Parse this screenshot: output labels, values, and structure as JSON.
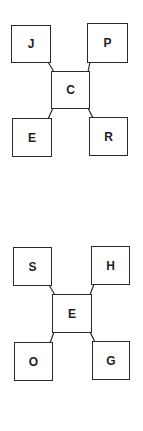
{
  "diagrams": [
    {
      "center": {
        "label": "C",
        "x": 51,
        "y": 71,
        "w": 39,
        "h": 38
      },
      "corners": [
        {
          "pos": "top-left",
          "label": "J",
          "x": 11,
          "y": 25,
          "w": 40,
          "h": 38
        },
        {
          "pos": "top-right",
          "label": "P",
          "x": 87,
          "y": 23,
          "w": 41,
          "h": 40
        },
        {
          "pos": "bottom-left",
          "label": "E",
          "x": 12,
          "y": 118,
          "w": 40,
          "h": 39
        },
        {
          "pos": "bottom-right",
          "label": "R",
          "x": 89,
          "y": 117,
          "w": 39,
          "h": 39
        }
      ]
    },
    {
      "center": {
        "label": "E",
        "x": 52,
        "y": 294,
        "w": 40,
        "h": 39
      },
      "corners": [
        {
          "pos": "top-left",
          "label": "S",
          "x": 13,
          "y": 247,
          "w": 39,
          "h": 39
        },
        {
          "pos": "top-right",
          "label": "H",
          "x": 91,
          "y": 246,
          "w": 39,
          "h": 39
        },
        {
          "pos": "bottom-left",
          "label": "O",
          "x": 14,
          "y": 342,
          "w": 39,
          "h": 39
        },
        {
          "pos": "bottom-right",
          "label": "G",
          "x": 92,
          "y": 341,
          "w": 38,
          "h": 39
        }
      ]
    }
  ],
  "colors": {
    "stroke": "#2a2a2a",
    "text": "#1e1e1e",
    "background": "#ffffff"
  }
}
